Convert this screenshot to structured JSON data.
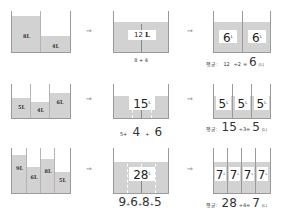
{
  "unit": "L",
  "avg_label": "평균:",
  "arrow_glyph": "⇒",
  "colors": {
    "water": "#d2d2d2",
    "outline": "#9a9a9a",
    "text": "#333333"
  },
  "rows": [
    {
      "amounts": [
        "8L",
        "4L"
      ],
      "total_label": "12",
      "sum_expr": "8 + 4",
      "avg": {
        "total": "12",
        "divisor": "÷2",
        "equals": "=",
        "result": "6",
        "unit": "(L)"
      },
      "equal_parts": [
        "6",
        "6"
      ]
    },
    {
      "amounts": [
        "5L",
        "4L",
        "6L"
      ],
      "total_label": "15",
      "sum_expr": {
        "a": "5+",
        "b": "4",
        "c": "+",
        "d": "6"
      },
      "avg": {
        "total": "15",
        "divisor": "÷3=",
        "result": "5",
        "unit": "(L)"
      },
      "equal_parts": [
        "5",
        "5",
        "5"
      ]
    },
    {
      "amounts": [
        "9L",
        "6L",
        "8L",
        "5L"
      ],
      "total_label": "28",
      "sum_expr": {
        "a": "9",
        "b": "+",
        "c": "6",
        "d": "+",
        "e": "8",
        "f": "+",
        "g": "5"
      },
      "avg": {
        "total": "28",
        "divisor": "÷4=",
        "result": "7",
        "unit": "(L)"
      },
      "equal_parts": [
        "7",
        "7",
        "7",
        "7"
      ]
    }
  ]
}
